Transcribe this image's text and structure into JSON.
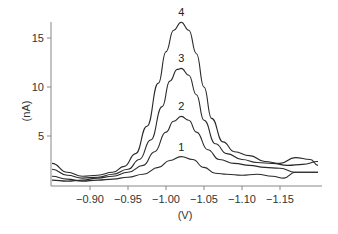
{
  "chart_data": {
    "type": "line",
    "title": "",
    "xlabel": "(V)",
    "ylabel": "(nA)",
    "xlim": [
      -0.85,
      -1.205
    ],
    "ylim": [
      0,
      17
    ],
    "x_reversed": true,
    "grid": false,
    "legend": "inline curve labels above peaks",
    "xticks": [
      -0.9,
      -0.95,
      -1.0,
      -1.05,
      -1.1,
      -1.15
    ],
    "xtick_labels": [
      "-0.90",
      "-0.95",
      "-1.00",
      "-1.05",
      "-1.10",
      "-1.15"
    ],
    "yticks": [
      5,
      10,
      15
    ],
    "ytick_labels": [
      "5",
      "10",
      "15"
    ],
    "series": [
      {
        "name": "1",
        "peak_x": -1.02,
        "peak_y": 2.9,
        "x": [
          -0.85,
          -0.87,
          -0.89,
          -0.91,
          -0.93,
          -0.95,
          -0.97,
          -0.99,
          -1.005,
          -1.02,
          -1.035,
          -1.05,
          -1.065,
          -1.08,
          -1.1,
          -1.12,
          -1.14,
          -1.155,
          -1.17,
          -1.19,
          -1.2
        ],
        "y": [
          0.9,
          0.6,
          0.4,
          0.5,
          0.6,
          0.8,
          1.1,
          1.8,
          2.5,
          2.9,
          2.6,
          1.8,
          1.2,
          1.1,
          1.0,
          1.1,
          0.9,
          0.7,
          1.3,
          1.3,
          1.3
        ]
      },
      {
        "name": "2",
        "peak_x": -1.02,
        "peak_y": 7.0,
        "x": [
          -0.85,
          -0.87,
          -0.89,
          -0.91,
          -0.93,
          -0.95,
          -0.97,
          -0.985,
          -1.0,
          -1.01,
          -1.02,
          -1.03,
          -1.04,
          -1.055,
          -1.07,
          -1.09,
          -1.11,
          -1.13,
          -1.15,
          -1.17,
          -1.19,
          -1.2
        ],
        "y": [
          0.5,
          0.4,
          0.5,
          0.7,
          0.9,
          1.3,
          2.0,
          3.4,
          5.4,
          6.5,
          7.0,
          6.6,
          5.4,
          3.6,
          2.6,
          2.2,
          2.0,
          1.8,
          1.7,
          1.3,
          1.3,
          1.3
        ]
      },
      {
        "name": "3",
        "peak_x": -1.02,
        "peak_y": 11.9,
        "x": [
          -0.85,
          -0.87,
          -0.89,
          -0.91,
          -0.93,
          -0.95,
          -0.965,
          -0.98,
          -0.995,
          -1.005,
          -1.015,
          -1.02,
          -1.03,
          -1.04,
          -1.05,
          -1.065,
          -1.08,
          -1.1,
          -1.12,
          -1.14,
          -1.16,
          -1.18,
          -1.2
        ],
        "y": [
          1.6,
          1.0,
          0.7,
          0.8,
          1.1,
          1.6,
          2.6,
          4.6,
          8.0,
          10.6,
          11.8,
          11.9,
          11.2,
          9.2,
          6.6,
          4.2,
          3.2,
          2.6,
          2.3,
          2.2,
          2.0,
          2.1,
          2.4
        ]
      },
      {
        "name": "4",
        "peak_x": -1.02,
        "peak_y": 16.6,
        "x": [
          -0.85,
          -0.87,
          -0.89,
          -0.91,
          -0.93,
          -0.945,
          -0.96,
          -0.975,
          -0.99,
          -1.0,
          -1.01,
          -1.02,
          -1.03,
          -1.04,
          -1.05,
          -1.06,
          -1.075,
          -1.09,
          -1.11,
          -1.13,
          -1.15,
          -1.17,
          -1.19,
          -1.2
        ],
        "y": [
          2.2,
          1.3,
          0.9,
          1.0,
          1.3,
          1.9,
          3.2,
          6.0,
          10.4,
          13.6,
          15.8,
          16.6,
          15.8,
          13.4,
          10.0,
          6.8,
          4.4,
          3.4,
          3.0,
          2.4,
          2.2,
          2.8,
          2.6,
          2.0
        ]
      }
    ]
  }
}
